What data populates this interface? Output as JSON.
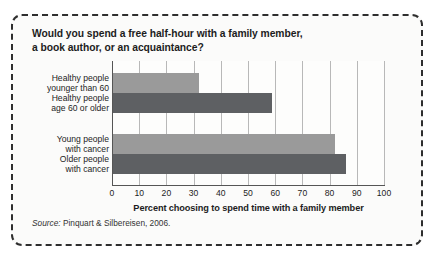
{
  "figure": {
    "title_lines": [
      "Would you spend a free half-hour with a family member,",
      "a book author, or an acquaintance?"
    ],
    "source_label": "Source:",
    "source_text": " Pinquart & Silbereisen, 2006."
  },
  "chart_data": {
    "type": "bar",
    "orientation": "horizontal",
    "title": "Would you spend a free half-hour with a family member, a book author, or an acquaintance?",
    "categories": [
      "Healthy people younger than 60",
      "Healthy people age 60 or older",
      "Young people with cancer",
      "Older people with cancer"
    ],
    "category_lines": [
      [
        "Healthy people",
        "younger than 60"
      ],
      [
        "Healthy people",
        "age 60 or older"
      ],
      [
        "Young people",
        "with cancer"
      ],
      [
        "Older people",
        "with cancer"
      ]
    ],
    "values": [
      32,
      59,
      82,
      86
    ],
    "bar_colors": [
      "#9a9a9a",
      "#5e6063",
      "#9a9a9a",
      "#5e6063"
    ],
    "groups": [
      0,
      0,
      1,
      1
    ],
    "xlabel": "Percent choosing to spend time with a family member",
    "ylabel": "",
    "xlim": [
      0,
      100
    ],
    "xticks": [
      0,
      10,
      20,
      30,
      40,
      50,
      60,
      70,
      80,
      90,
      100
    ],
    "xtick_labels": [
      "0",
      "10",
      "20",
      "30",
      "40",
      "50",
      "60",
      "70",
      "80",
      "90",
      "100"
    ],
    "grid": true,
    "grid_axis": "x",
    "legend": false
  }
}
